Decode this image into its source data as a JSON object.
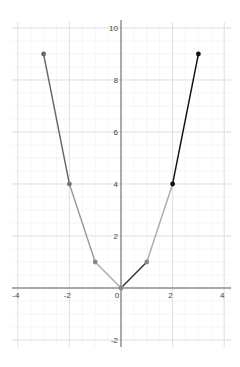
{
  "chart_data": {
    "type": "line",
    "title": "",
    "xlabel": "",
    "ylabel": "",
    "xlim": [
      -4.2,
      4.2
    ],
    "ylim": [
      -2.3,
      10.3
    ],
    "grid": true,
    "x_ticks": [
      -4,
      -2,
      0,
      2,
      4
    ],
    "y_ticks": [
      -2,
      2,
      4,
      6,
      8,
      10
    ],
    "x_tick_labels": [
      "-4",
      "-2",
      "0",
      "2",
      "4"
    ],
    "y_tick_labels": [
      "-2",
      "2",
      "4",
      "6",
      "8",
      "10"
    ],
    "points": [
      {
        "x": -3,
        "y": 9,
        "color": "#666666"
      },
      {
        "x": -2,
        "y": 4,
        "color": "#777777"
      },
      {
        "x": -1,
        "y": 1,
        "color": "#888888"
      },
      {
        "x": 0,
        "y": 0,
        "color": "#888888"
      },
      {
        "x": 1,
        "y": 1,
        "color": "#888888"
      },
      {
        "x": 2,
        "y": 4,
        "color": "#111111"
      },
      {
        "x": 3,
        "y": 9,
        "color": "#111111"
      }
    ],
    "segments": [
      {
        "from": [
          -3,
          9
        ],
        "to": [
          -2,
          4
        ],
        "color": "#666666"
      },
      {
        "from": [
          -2,
          4
        ],
        "to": [
          -1,
          1
        ],
        "color": "#999999"
      },
      {
        "from": [
          -1,
          1
        ],
        "to": [
          0,
          0
        ],
        "color": "#aaaaaa"
      },
      {
        "from": [
          0,
          0
        ],
        "to": [
          1,
          1
        ],
        "color": "#333333"
      },
      {
        "from": [
          1,
          1
        ],
        "to": [
          2,
          4
        ],
        "color": "#aaaaaa"
      },
      {
        "from": [
          2,
          4
        ],
        "to": [
          3,
          9
        ],
        "color": "#111111"
      }
    ],
    "series": [
      {
        "name": "y = x^2",
        "x": [
          -3,
          -2,
          -1,
          0,
          1,
          2,
          3
        ],
        "values": [
          9,
          4,
          1,
          0,
          1,
          4,
          9
        ]
      }
    ]
  }
}
